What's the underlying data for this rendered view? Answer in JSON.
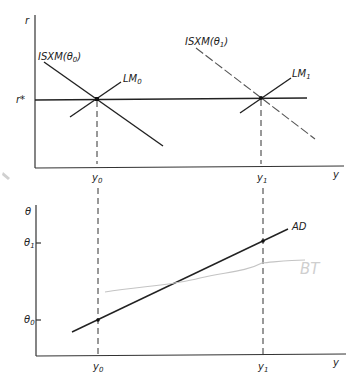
{
  "top_panel": {
    "y_axis_label": "r",
    "x_axis_label": "y",
    "r_star_label": "r*",
    "x_ticks": [
      "y0",
      "y1"
    ],
    "curves": {
      "isxm0": {
        "label": "ISXM(θ0)",
        "base": "ISXM(θ",
        "sub": "0",
        "close": ")",
        "style": "solid"
      },
      "isxm1": {
        "label": "ISXM(θ1)",
        "base": "ISXM(θ",
        "sub": "1",
        "close": ")",
        "style": "dashed"
      },
      "lm0": {
        "label": "LM0",
        "base": "LM",
        "sub": "0",
        "style": "solid"
      },
      "lm1": {
        "label": "LM1",
        "base": "LM",
        "sub": "1",
        "style": "solid"
      }
    },
    "equilibria": [
      {
        "name": "E0",
        "x": "y0",
        "y": "r*"
      },
      {
        "name": "E1",
        "x": "y1",
        "y": "r*"
      }
    ]
  },
  "bottom_panel": {
    "y_axis_label": "θ",
    "x_axis_label": "y",
    "y_ticks": [
      {
        "base": "θ",
        "sub": "1"
      },
      {
        "base": "θ",
        "sub": "0"
      }
    ],
    "x_ticks": [
      {
        "base": "y",
        "sub": "0"
      },
      {
        "base": "y",
        "sub": "1"
      }
    ],
    "curves": {
      "ad": {
        "label": "AD",
        "style": "solid"
      }
    },
    "points": [
      {
        "x": "y0",
        "y": "θ0"
      },
      {
        "x": "y1",
        "y": "θ1"
      }
    ],
    "annotation": {
      "text": "BT",
      "note": "handwritten pencil mark"
    }
  },
  "labels": {
    "y_base": "y",
    "sub0": "0",
    "sub1": "1",
    "theta": "θ",
    "r": "r",
    "r_star": "r*",
    "ad": "AD",
    "pencil_text": "BT"
  },
  "colors": {
    "ink": "#222222",
    "pencil": "#c4c4c4",
    "background": "#ffffff"
  }
}
